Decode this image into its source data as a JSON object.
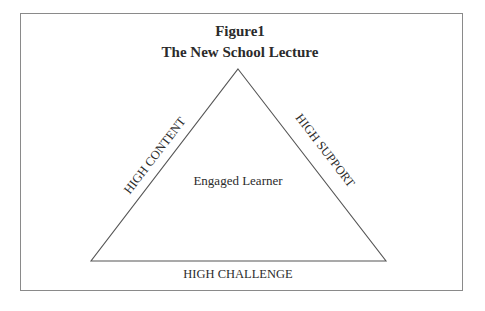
{
  "figure": {
    "title_line1": "Figure1",
    "title_line2": "The New School Lecture",
    "center_label": "Engaged Learner",
    "left_side_label": "HIGH CONTENT",
    "right_side_label": "HIGH SUPPORT",
    "base_label": "HIGH CHALLENGE"
  },
  "colors": {
    "frame": "#8a8a8a",
    "line": "#555555",
    "text": "#2b2b2b"
  }
}
